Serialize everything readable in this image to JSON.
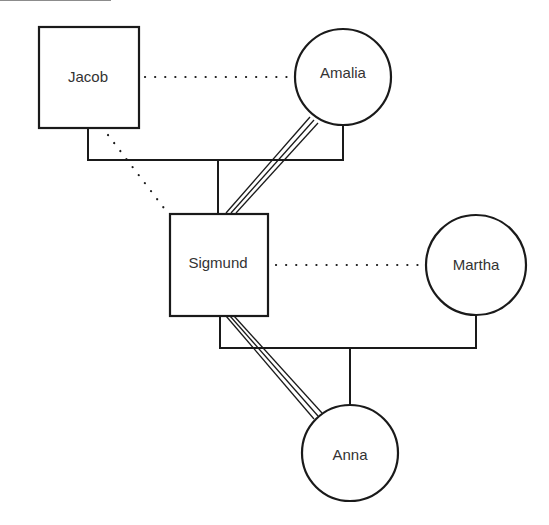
{
  "nodes": {
    "jacob": {
      "label": "Jacob",
      "shape": "square",
      "sex": "male"
    },
    "amalia": {
      "label": "Amalia",
      "shape": "circle",
      "sex": "female"
    },
    "sigmund": {
      "label": "Sigmund",
      "shape": "square",
      "sex": "male"
    },
    "martha": {
      "label": "Martha",
      "shape": "circle",
      "sex": "female"
    },
    "anna": {
      "label": "Anna",
      "shape": "circle",
      "sex": "female"
    }
  },
  "relationships": [
    {
      "from": "Jacob",
      "to": "Amalia",
      "type": "marriage",
      "line": "solid"
    },
    {
      "from": "Jacob",
      "to": "Amalia",
      "type": "relationship",
      "line": "dotted"
    },
    {
      "from": "Jacob",
      "to": "Sigmund",
      "type": "relationship",
      "line": "dotted"
    },
    {
      "from": "Amalia",
      "to": "Sigmund",
      "type": "very close",
      "line": "triple"
    },
    {
      "from": "Sigmund",
      "to": "Martha",
      "type": "marriage",
      "line": "solid"
    },
    {
      "from": "Sigmund",
      "to": "Martha",
      "type": "relationship",
      "line": "dotted"
    },
    {
      "from": "Sigmund",
      "to": "Anna",
      "type": "very close",
      "line": "triple"
    }
  ],
  "colors": {
    "stroke": "#1a1a1a",
    "text": "#333333",
    "background": "#ffffff"
  }
}
